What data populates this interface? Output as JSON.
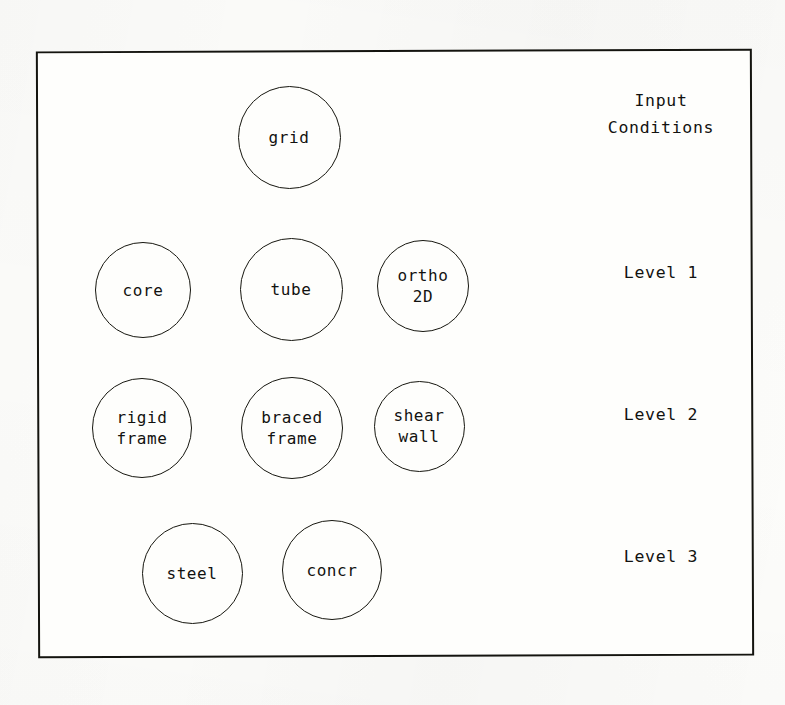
{
  "diagram": {
    "frame": {
      "border_color": "#14140f",
      "background": "#fefefc"
    },
    "nodes": [
      {
        "id": "grid",
        "label": "grid",
        "row": "input",
        "cx": 289,
        "cy": 137,
        "d": 103
      },
      {
        "id": "core",
        "label": "core",
        "row": "level-1",
        "cx": 143,
        "cy": 290,
        "d": 96
      },
      {
        "id": "tube",
        "label": "tube",
        "row": "level-1",
        "cx": 291,
        "cy": 289,
        "d": 103
      },
      {
        "id": "ortho-2d",
        "label": "ortho\n2D",
        "row": "level-1",
        "cx": 423,
        "cy": 286,
        "d": 92
      },
      {
        "id": "rigid-frame",
        "label": "rigid\nframe",
        "row": "level-2",
        "cx": 142,
        "cy": 428,
        "d": 100
      },
      {
        "id": "braced-frame",
        "label": "braced\nframe",
        "row": "level-2",
        "cx": 292,
        "cy": 428,
        "d": 102
      },
      {
        "id": "shear-wall",
        "label": "shear\nwall",
        "row": "level-2",
        "cx": 419,
        "cy": 426,
        "d": 91
      },
      {
        "id": "steel",
        "label": "steel",
        "row": "level-3",
        "cx": 192,
        "cy": 573,
        "d": 101
      },
      {
        "id": "concr",
        "label": "concr",
        "row": "level-3",
        "cx": 332,
        "cy": 570,
        "d": 100
      }
    ],
    "row_labels": [
      {
        "id": "input-conditions",
        "text": "Input\nConditions",
        "cx": 661,
        "cy": 114
      },
      {
        "id": "level-1",
        "text": "Level 1",
        "cx": 661,
        "cy": 286
      },
      {
        "id": "level-2",
        "text": "Level 2",
        "cx": 661,
        "cy": 428
      },
      {
        "id": "level-3",
        "text": "Level 3",
        "cx": 661,
        "cy": 570
      }
    ]
  }
}
